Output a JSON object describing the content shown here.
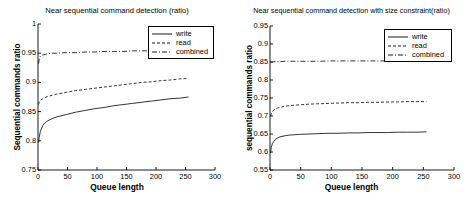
{
  "figure": {
    "background": "#ffffff",
    "line_color": "#000000"
  },
  "charts": [
    {
      "id": "left",
      "title": "Near sequential command detection (ratio)",
      "xlabel": "Queue length",
      "ylabel": "Sequential commands ratio",
      "xticks": [
        "0",
        "50",
        "100",
        "150",
        "200",
        "250",
        "300"
      ],
      "yticks": [
        "0.75",
        "0.8",
        "0.85",
        "0.9",
        "0.95",
        "1"
      ],
      "legend": [
        {
          "label": "write",
          "style": "solid"
        },
        {
          "label": "read",
          "style": "dashed"
        },
        {
          "label": "combined",
          "style": "dashdot"
        }
      ]
    },
    {
      "id": "right",
      "title": "Near sequential command detection with size constraint(ratio)",
      "xlabel": "Queue length",
      "ylabel": "sequential commands ratio",
      "xticks": [
        "0",
        "50",
        "100",
        "150",
        "200",
        "250",
        "300"
      ],
      "yticks": [
        "0.55",
        "0.6",
        "0.65",
        "0.7",
        "0.75",
        "0.8",
        "0.85",
        "0.9",
        "0.95"
      ],
      "legend": [
        {
          "label": "write",
          "style": "solid"
        },
        {
          "label": "read",
          "style": "dashed"
        },
        {
          "label": "combined",
          "style": "dashdot"
        }
      ]
    }
  ],
  "chart_data": [
    {
      "type": "line",
      "title": "Near sequential command detection (ratio)",
      "xlabel": "Queue length",
      "ylabel": "Sequential commands ratio",
      "xlim": [
        0,
        300
      ],
      "ylim": [
        0.75,
        1.0
      ],
      "xticks": [
        0,
        50,
        100,
        150,
        200,
        250,
        300
      ],
      "yticks": [
        0.75,
        0.8,
        0.85,
        0.9,
        0.95,
        1.0
      ],
      "grid": false,
      "legend_position": "upper right",
      "x": [
        1,
        2,
        4,
        8,
        12,
        16,
        24,
        32,
        48,
        64,
        80,
        96,
        112,
        128,
        144,
        160,
        176,
        192,
        208,
        224,
        240,
        255
      ],
      "series": [
        {
          "name": "write",
          "style": "solid",
          "values": [
            0.797,
            0.806,
            0.816,
            0.826,
            0.831,
            0.834,
            0.838,
            0.841,
            0.845,
            0.849,
            0.852,
            0.855,
            0.857,
            0.86,
            0.862,
            0.864,
            0.866,
            0.868,
            0.87,
            0.872,
            0.873,
            0.875
          ]
        },
        {
          "name": "read",
          "style": "dashed",
          "values": [
            0.862,
            0.866,
            0.869,
            0.872,
            0.874,
            0.876,
            0.878,
            0.88,
            0.883,
            0.886,
            0.888,
            0.89,
            0.892,
            0.894,
            0.896,
            0.898,
            0.9,
            0.901,
            0.903,
            0.904,
            0.906,
            0.907
          ]
        },
        {
          "name": "combined",
          "style": "dashdot",
          "values": [
            0.932,
            0.94,
            0.945,
            0.947,
            0.948,
            0.949,
            0.95,
            0.95,
            0.951,
            0.951,
            0.952,
            0.952,
            0.953,
            0.953,
            0.953,
            0.954,
            0.954,
            0.954,
            0.955,
            0.955,
            0.955,
            0.956
          ]
        }
      ]
    },
    {
      "type": "line",
      "title": "Near sequential command detection with size constraint(ratio)",
      "xlabel": "Queue length",
      "ylabel": "sequential commands ratio",
      "xlim": [
        0,
        300
      ],
      "ylim": [
        0.55,
        0.95
      ],
      "xticks": [
        0,
        50,
        100,
        150,
        200,
        250,
        300
      ],
      "yticks": [
        0.55,
        0.6,
        0.65,
        0.7,
        0.75,
        0.8,
        0.85,
        0.9,
        0.95
      ],
      "grid": false,
      "legend_position": "upper right",
      "x": [
        1,
        2,
        4,
        8,
        12,
        16,
        24,
        32,
        48,
        64,
        80,
        96,
        112,
        128,
        144,
        160,
        176,
        192,
        208,
        224,
        240,
        255
      ],
      "series": [
        {
          "name": "write",
          "style": "solid",
          "values": [
            0.598,
            0.612,
            0.624,
            0.634,
            0.639,
            0.642,
            0.645,
            0.647,
            0.649,
            0.65,
            0.651,
            0.652,
            0.652,
            0.653,
            0.653,
            0.654,
            0.654,
            0.654,
            0.655,
            0.655,
            0.655,
            0.656
          ]
        },
        {
          "name": "read",
          "style": "dashed",
          "values": [
            0.7,
            0.706,
            0.713,
            0.719,
            0.722,
            0.724,
            0.727,
            0.729,
            0.731,
            0.733,
            0.734,
            0.735,
            0.736,
            0.737,
            0.737,
            0.738,
            0.738,
            0.739,
            0.739,
            0.74,
            0.74,
            0.74
          ]
        },
        {
          "name": "combined",
          "style": "dashdot",
          "values": [
            0.848,
            0.849,
            0.85,
            0.851,
            0.851,
            0.851,
            0.852,
            0.852,
            0.852,
            0.852,
            0.852,
            0.853,
            0.853,
            0.853,
            0.853,
            0.853,
            0.853,
            0.853,
            0.853,
            0.854,
            0.854,
            0.854
          ]
        }
      ]
    }
  ]
}
